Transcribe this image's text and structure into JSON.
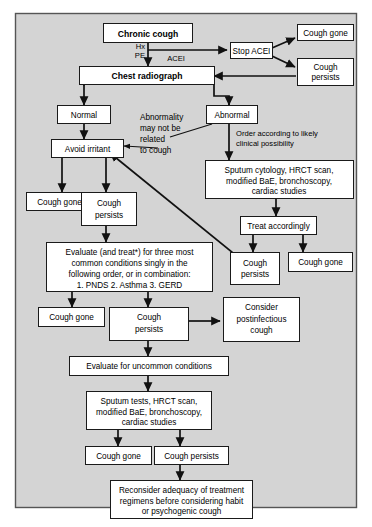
{
  "figure": {
    "background_color": "#d4d4d4",
    "box_fill": "#ffffff",
    "line_color": "#111111"
  },
  "nodes": {
    "chronic_cough": "Chronic cough",
    "stop_acei": "Stop ACEI",
    "cough_gone_acei": "Cough gone",
    "cough_persists_acei_l1": "Cough",
    "cough_persists_acei_l2": "persists",
    "chest_radiograph": "Chest radiograph",
    "normal": "Normal",
    "abnormal": "Abnormal",
    "avoid_irritant": "Avoid irritant",
    "cough_gone_irritant": "Cough gone",
    "cough_persists_irritant_l1": "Cough",
    "cough_persists_irritant_l2": "persists",
    "sputum_cytology_l1": "Sputum cytology, HRCT scan,",
    "sputum_cytology_l2": "modified BaE, bronchoscopy,",
    "sputum_cytology_l3": "cardiac studies",
    "treat_accordingly": "Treat accordingly",
    "cough_persists_treat_l1": "Cough",
    "cough_persists_treat_l2": "persists",
    "cough_gone_treat": "Cough gone",
    "evaluate_common_l1": "Evaluate (and treat*) for three most",
    "evaluate_common_l2": "common conditions singly in the",
    "evaluate_common_l3": "following order, or in combination:",
    "evaluate_common_l4": "1. PNDS   2. Asthma   3. GERD",
    "cough_gone_common": "Cough gone",
    "cough_persists_common_l1": "Cough",
    "cough_persists_common_l2": "persists",
    "consider_postinfectious_l1": "Consider",
    "consider_postinfectious_l2": "postinfectious",
    "consider_postinfectious_l3": "cough",
    "evaluate_uncommon": "Evaluate for uncommon conditions",
    "sputum_tests_l1": "Sputum tests, HRCT scan,",
    "sputum_tests_l2": "modified BaE, bronchoscopy,",
    "sputum_tests_l3": "cardiac studies",
    "cough_gone_uncommon": "Cough gone",
    "cough_persists_uncommon": "Cough persists",
    "reconsider_l1": "Reconsider adequacy of treatment",
    "reconsider_l2": "regimens before considering habit",
    "reconsider_l3": "or psychogenic cough"
  },
  "edge_labels": {
    "hx": "Hx",
    "pe": "PE",
    "acei": "ACEI",
    "order_according_l1": "Order according to likely",
    "order_according_l2": "clinical possibility"
  },
  "annotations": {
    "abnormality_note_l1": "Abnormality",
    "abnormality_note_l2": "may not be",
    "abnormality_note_l3": "related",
    "abnormality_note_l4": "to cough"
  }
}
